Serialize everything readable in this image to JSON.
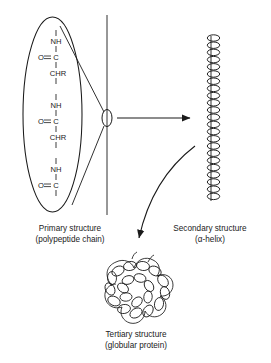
{
  "figure": {
    "background_color": "#ffffff",
    "ink_color": "#1a1a1a"
  },
  "primary": {
    "caption_line1": "Primary structure",
    "caption_line2": "(polypeptide chain)",
    "chain_residues": [
      {
        "label": "NH"
      },
      {
        "label": "O=C"
      },
      {
        "label": "CHR"
      },
      {
        "label": "NH"
      },
      {
        "label": "O=C"
      },
      {
        "label": "CHR"
      },
      {
        "label": "NH"
      },
      {
        "label": "O=C"
      }
    ]
  },
  "secondary": {
    "caption_line1": "Secondary structure",
    "caption_line2": "(α-helix)",
    "coil_turns": 23
  },
  "tertiary": {
    "caption_line1": "Tertiary structure",
    "caption_line2": "(globular protein)"
  },
  "connectors": {
    "straight_arrow_label": "to-secondary-structure",
    "curved_arrow_label": "to-tertiary-structure"
  }
}
